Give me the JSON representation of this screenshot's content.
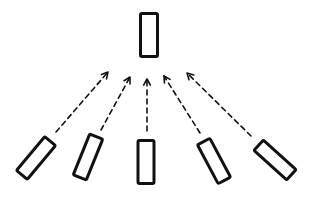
{
  "diagram": {
    "colors": {
      "stroke": "#111111",
      "background": "#ffffff"
    },
    "target": {
      "id": "top-box",
      "cx": 149,
      "cy": 35,
      "w": 17,
      "h": 43,
      "rotate": 0
    },
    "sources": [
      {
        "id": "source-box-1",
        "cx": 36,
        "cy": 158,
        "w": 14,
        "h": 44,
        "rotate": 40
      },
      {
        "id": "source-box-2",
        "cx": 88,
        "cy": 157,
        "w": 14,
        "h": 44,
        "rotate": 22
      },
      {
        "id": "source-box-3",
        "cx": 146,
        "cy": 162,
        "w": 16,
        "h": 43,
        "rotate": 0
      },
      {
        "id": "source-box-4",
        "cx": 214,
        "cy": 161,
        "w": 14,
        "h": 44,
        "rotate": -28
      },
      {
        "id": "source-box-5",
        "cx": 275,
        "cy": 160,
        "w": 14,
        "h": 44,
        "rotate": -48
      }
    ],
    "arrows": [
      {
        "id": "arrow-1",
        "from": [
          56,
          132
        ],
        "to": [
          108,
          72
        ],
        "style": "dashed"
      },
      {
        "id": "arrow-2",
        "from": [
          101,
          130
        ],
        "to": [
          130,
          77
        ],
        "style": "dashed"
      },
      {
        "id": "arrow-3",
        "from": [
          147,
          131
        ],
        "to": [
          147,
          79
        ],
        "style": "dashed"
      },
      {
        "id": "arrow-4",
        "from": [
          200,
          133
        ],
        "to": [
          164,
          76
        ],
        "style": "dashed"
      },
      {
        "id": "arrow-5",
        "from": [
          251,
          136
        ],
        "to": [
          187,
          73
        ],
        "style": "dashed"
      }
    ]
  }
}
